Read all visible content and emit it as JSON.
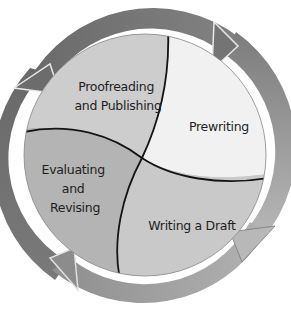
{
  "diagram": {
    "type": "cycle",
    "stages": [
      {
        "id": "prewriting",
        "label_lines": [
          "Prewriting"
        ],
        "fill": "#f1f1f1"
      },
      {
        "id": "writing-draft",
        "label_lines": [
          "Writing a Draft"
        ],
        "fill": "#c9c9c9"
      },
      {
        "id": "evaluating-revising",
        "label_lines": [
          "Evaluating",
          "and",
          "Revising"
        ],
        "fill": "#b4b4b4"
      },
      {
        "id": "proofreading-publishing",
        "label_lines": [
          "Proofreading",
          "and Publishing"
        ],
        "fill": "#cdcdcd"
      }
    ],
    "ring_colors": {
      "top": "#7a7a7a",
      "right": "#909090",
      "bottom": "#a6a6a6",
      "left": "#6e6e6e"
    },
    "divider_color": "#141414"
  }
}
